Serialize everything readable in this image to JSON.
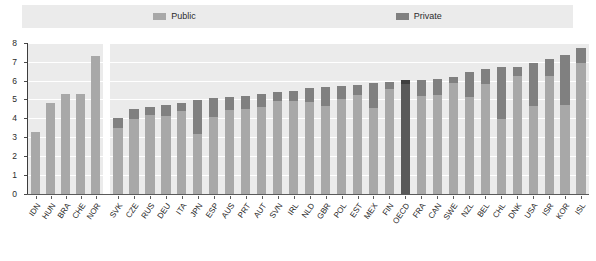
{
  "legend": {
    "items": [
      {
        "label": "Public",
        "color": "#a8a8a8",
        "name": "public"
      },
      {
        "label": "Private",
        "color": "#808080",
        "name": "private"
      }
    ]
  },
  "axes": {
    "y_ticks": [
      "0",
      "1",
      "2",
      "3",
      "4",
      "5",
      "6",
      "7",
      "8"
    ],
    "y_min": 0,
    "y_max": 8
  },
  "chart_data": {
    "type": "bar",
    "title": "",
    "subtitle": "",
    "xlabel": "",
    "ylabel": "",
    "ylim": [
      0,
      8
    ],
    "yticks": [
      0,
      1,
      2,
      3,
      4,
      5,
      6,
      7,
      8
    ],
    "grid": true,
    "stacked": true,
    "legend_position": "top",
    "legend": [
      "Public",
      "Private"
    ],
    "series": [
      {
        "name": "Public",
        "color": "#a8a8a8"
      },
      {
        "name": "Private",
        "color": "#808080"
      }
    ],
    "panels": [
      {
        "name": "left-panel",
        "categories": [
          "IDN",
          "HUN",
          "BRA",
          "CHE",
          "NOR"
        ],
        "public": [
          3.25,
          4.8,
          5.3,
          5.3,
          7.3
        ],
        "private": [
          0.0,
          0.0,
          0.0,
          0.0,
          0.0
        ],
        "totals": [
          3.25,
          4.8,
          5.3,
          5.3,
          7.3
        ],
        "highlight": []
      },
      {
        "name": "right-panel",
        "categories": [
          "SVK",
          "CZE",
          "RUS",
          "DEU",
          "ITA",
          "JPN",
          "ESP",
          "AUS",
          "PRT",
          "AUT",
          "SVN",
          "IRL",
          "NLD",
          "GBR",
          "POL",
          "EST",
          "MEX",
          "FIN",
          "OECD",
          "FRA",
          "CAN",
          "SWE",
          "NZL",
          "BEL",
          "CHL",
          "DNK",
          "USA",
          "ISR",
          "KOR",
          "ISL"
        ],
        "public": [
          3.5,
          3.95,
          4.15,
          4.1,
          4.4,
          3.15,
          4.05,
          4.45,
          4.5,
          4.6,
          4.9,
          4.9,
          4.85,
          4.65,
          5.05,
          5.25,
          4.55,
          5.55,
          5.8,
          5.2,
          5.25,
          5.85,
          5.15,
          5.8,
          3.95,
          6.25,
          4.65,
          6.25,
          4.7,
          6.95
        ],
        "private": [
          0.5,
          0.55,
          0.45,
          0.6,
          0.4,
          1.8,
          1.05,
          0.7,
          0.7,
          0.7,
          0.5,
          0.55,
          0.75,
          1.0,
          0.65,
          0.5,
          1.35,
          0.4,
          0.25,
          0.85,
          0.85,
          0.35,
          1.3,
          0.8,
          2.75,
          0.5,
          2.3,
          0.9,
          2.65,
          0.8
        ],
        "totals": [
          4.0,
          4.5,
          4.6,
          4.7,
          4.8,
          4.95,
          5.1,
          5.15,
          5.2,
          5.3,
          5.4,
          5.45,
          5.6,
          5.65,
          5.7,
          5.75,
          5.9,
          5.95,
          6.05,
          6.05,
          6.1,
          6.2,
          6.45,
          6.6,
          6.7,
          6.75,
          6.95,
          7.15,
          7.35,
          7.75
        ],
        "highlight": [
          "OECD"
        ]
      }
    ]
  }
}
